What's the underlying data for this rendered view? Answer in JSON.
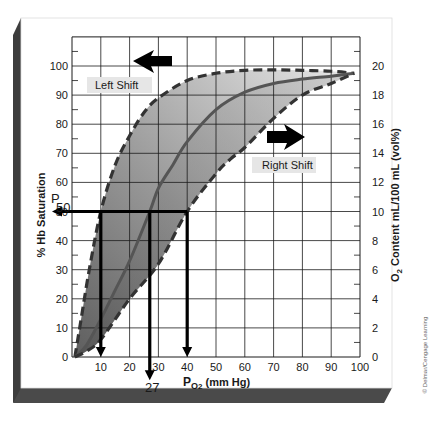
{
  "chart_data": {
    "type": "line",
    "xlabel": "PO2 (mm Hg)",
    "ylabel": "% Hb Saturation",
    "y2label": "O2 Content mL/100 mL (vol%)",
    "xlim": [
      0,
      100
    ],
    "ylim": [
      0,
      110
    ],
    "y2lim": [
      0,
      22
    ],
    "x_ticks": [
      10,
      20,
      30,
      40,
      50,
      60,
      70,
      80,
      90,
      100
    ],
    "y_ticks": [
      0,
      10,
      20,
      30,
      40,
      50,
      60,
      70,
      80,
      90,
      100
    ],
    "y2_ticks": [
      0,
      2,
      4,
      6,
      8,
      10,
      12,
      14,
      16,
      18,
      20
    ],
    "grid": true,
    "series": [
      {
        "name": "Left Shift",
        "style": "dashed",
        "x": [
          1,
          3,
          6,
          10,
          15,
          20,
          25,
          30,
          40,
          50,
          60,
          70,
          80,
          90,
          98
        ],
        "values": [
          0,
          12,
          30,
          50,
          66,
          76,
          84,
          89,
          95,
          97.5,
          98.5,
          98.7,
          98.5,
          98.2,
          97.5
        ]
      },
      {
        "name": "Normal",
        "style": "solid",
        "x": [
          1,
          5,
          10,
          15,
          20,
          27,
          30,
          35,
          40,
          50,
          60,
          70,
          80,
          90,
          98
        ],
        "values": [
          0,
          4,
          13,
          23,
          33,
          50,
          58,
          66,
          74,
          85,
          91,
          94,
          95.5,
          96.5,
          97.5
        ]
      },
      {
        "name": "Right Shift",
        "style": "dashed",
        "x": [
          1,
          5,
          10,
          20,
          30,
          40,
          50,
          55,
          60,
          70,
          80,
          90,
          98
        ],
        "values": [
          0,
          2,
          6,
          20,
          32,
          50,
          63,
          68,
          72,
          82,
          90,
          94,
          97.5
        ]
      }
    ],
    "annotations": [
      {
        "text": "Left Shift",
        "x": 10,
        "y": 95,
        "arrow": "left"
      },
      {
        "text": "Right Shift",
        "x": 63,
        "y": 66,
        "arrow": "right"
      },
      {
        "text": "P50",
        "x": 0,
        "y": 50
      },
      {
        "text": "27",
        "x": 27,
        "y": -5
      }
    ],
    "reference_lines": [
      {
        "type": "horizontal",
        "y": 50,
        "from_x": 0,
        "to_x": 40
      },
      {
        "type": "vertical",
        "x": 10,
        "from_y": 50,
        "to_y": 0
      },
      {
        "type": "vertical",
        "x": 27,
        "from_y": 50,
        "to_y": -8
      },
      {
        "type": "vertical",
        "x": 40,
        "from_y": 50,
        "to_y": 0
      }
    ]
  },
  "labels": {
    "left_shift": "Left Shift",
    "right_shift": "Right Shift",
    "p50_p": "P",
    "p50_sub": "50",
    "p50_value": "27",
    "xlabel_main": "P",
    "xlabel_sub": "O2",
    "xlabel_sub_o": "O",
    "xlabel_sub_2": "2",
    "xlabel_units": " (mm Hg)",
    "ylabel": "% Hb Saturation",
    "y2label_o": "O",
    "y2label_2": "2",
    "y2label_rest": " Content mL/100 mL (vol%)",
    "credit": "© Delmar/Cengage Learning"
  },
  "colors": {
    "frame_bevel": "#3a3a3a",
    "grid": "#1a1a1a",
    "band_light": "#d9d9d9",
    "band_dark": "#7a7a7a",
    "curve": "#3c3c3c",
    "normal_curve": "#555555",
    "label_bg": "#e6e6e6"
  }
}
